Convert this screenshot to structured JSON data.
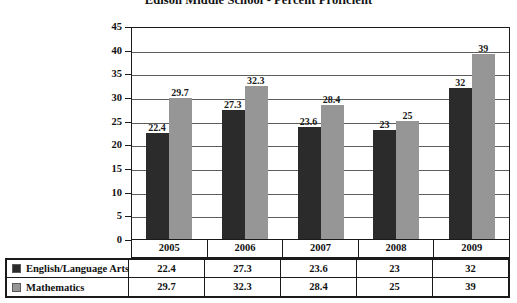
{
  "chart_data": {
    "type": "bar",
    "title": "Edison Middle School - Percent Proficient",
    "xlabel": "",
    "ylabel": "",
    "categories": [
      "2005",
      "2006",
      "2007",
      "2008",
      "2009"
    ],
    "series": [
      {
        "name": "English/Language Arts",
        "color": "#2b2b2b",
        "values": [
          22.4,
          27.3,
          23.6,
          23,
          32
        ],
        "labels": [
          "22.4",
          "27.3",
          "23.6",
          "23",
          "32"
        ]
      },
      {
        "name": "Mathematics",
        "color": "#969696",
        "values": [
          29.7,
          32.3,
          28.4,
          25,
          39
        ],
        "labels": [
          "29.7",
          "32.3",
          "28.4",
          "25",
          "39"
        ]
      }
    ],
    "ylim": [
      0,
      45
    ],
    "yticks": [
      0,
      5,
      10,
      15,
      20,
      25,
      30,
      35,
      40,
      45
    ],
    "ytick_labels": [
      "0",
      "5",
      "10",
      "15",
      "20",
      "25",
      "30",
      "35",
      "40",
      "45"
    ],
    "grid": true,
    "legend_position": "table-left",
    "data_labels": true
  },
  "table": {
    "header": [
      "",
      "2005",
      "2006",
      "2007",
      "2008",
      "2009"
    ],
    "rows": [
      {
        "label": "English/Language Arts",
        "swatch": "#2b2b2b",
        "values": [
          "22.4",
          "27.3",
          "23.6",
          "23",
          "32"
        ]
      },
      {
        "label": "Mathematics",
        "swatch": "#969696",
        "values": [
          "29.7",
          "32.3",
          "28.4",
          "25",
          "39"
        ]
      }
    ]
  }
}
